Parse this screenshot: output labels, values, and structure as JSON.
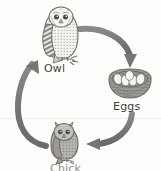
{
  "diagram": {
    "type": "cycle",
    "background_color": "#fdfdfb",
    "arrow_color": "#7a7a7a",
    "ink_color": "#3d3d3d",
    "bleed_text": "",
    "stages": [
      {
        "id": "owl",
        "label": "Owl",
        "icon": "owl-illustration",
        "order": 1
      },
      {
        "id": "eggs",
        "label": "Eggs",
        "icon": "nest-with-eggs-illustration",
        "order": 2,
        "egg_count": 5
      },
      {
        "id": "chick",
        "label": "Chick",
        "icon": "owl-chick-illustration",
        "order": 3,
        "note": "label cropped at bottom edge"
      }
    ],
    "arrows": [
      {
        "id": "owl-to-eggs",
        "from": "owl",
        "to": "eggs",
        "name": "arrow-owl-to-eggs"
      },
      {
        "id": "eggs-to-chick",
        "from": "eggs",
        "to": "chick",
        "name": "arrow-eggs-to-chick"
      },
      {
        "id": "chick-to-owl",
        "from": "chick",
        "to": "owl",
        "name": "arrow-chick-to-owl"
      }
    ]
  }
}
